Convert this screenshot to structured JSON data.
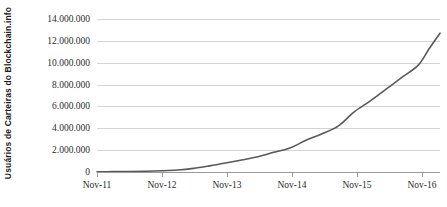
{
  "chart_data": {
    "type": "line",
    "title": "",
    "xlabel": "",
    "ylabel": "Usuários de Carteiras do Blockchain.info",
    "ylim": [
      0,
      14000000
    ],
    "ytick_values": [
      0,
      2000000,
      4000000,
      6000000,
      8000000,
      10000000,
      12000000,
      14000000
    ],
    "ytick_labels": [
      "0",
      "2.000.000",
      "4.000.000",
      "6.000.000",
      "8.000.000",
      "10.000.000",
      "12.000.000",
      "14.000.000"
    ],
    "xtick_labels": [
      "Nov-11",
      "Nov-12",
      "Nov-13",
      "Nov-14",
      "Nov-15",
      "Nov-16"
    ],
    "xlim_labels": [
      "Nov-11",
      "Mar-17"
    ],
    "grid": "horizontal",
    "legend": "none",
    "line_color": "#595959",
    "gridline_color": "#d4d4d4",
    "axis_color": "#9a9a9a",
    "background_color": "#ffffff",
    "series": [
      {
        "name": "Usuários de Carteiras do Blockchain.info",
        "x": [
          "Nov-11",
          "Feb-12",
          "May-12",
          "Aug-12",
          "Nov-12",
          "Feb-13",
          "May-13",
          "Aug-13",
          "Nov-13",
          "Feb-14",
          "May-14",
          "Aug-14",
          "Nov-14",
          "Feb-15",
          "May-15",
          "Aug-15",
          "Nov-15",
          "Feb-16",
          "May-16",
          "Aug-16",
          "Nov-16",
          "Jan-17",
          "Mar-17"
        ],
        "values": [
          20000,
          30000,
          45000,
          70000,
          110000,
          180000,
          330000,
          560000,
          820000,
          1100000,
          1400000,
          1800000,
          2200000,
          2900000,
          3500000,
          4200000,
          5500000,
          6500000,
          7600000,
          8700000,
          9800000,
          11300000,
          12700000
        ]
      }
    ]
  }
}
